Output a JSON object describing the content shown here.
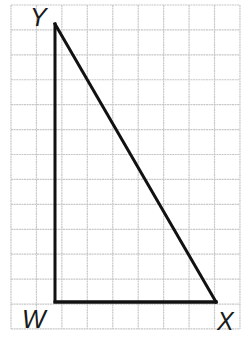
{
  "diagram": {
    "type": "right-triangle-on-grid",
    "grid": {
      "x0": 11,
      "y0": 5,
      "cols": 9,
      "rows": 13,
      "cell_w": 25.44,
      "cell_h": 24.92,
      "line_color": "#c8c8c8"
    },
    "triangle": {
      "stroke_color": "#111111",
      "vertices": [
        {
          "name": "Y",
          "x": 55,
          "y": 24
        },
        {
          "name": "W",
          "x": 55,
          "y": 302
        },
        {
          "name": "X",
          "x": 216,
          "y": 302
        }
      ],
      "right_angle_at": "W"
    },
    "labels": [
      {
        "text": "Y",
        "x": 30,
        "y": 26
      },
      {
        "text": "W",
        "x": 22,
        "y": 328
      },
      {
        "text": "X",
        "x": 217,
        "y": 330
      }
    ]
  }
}
